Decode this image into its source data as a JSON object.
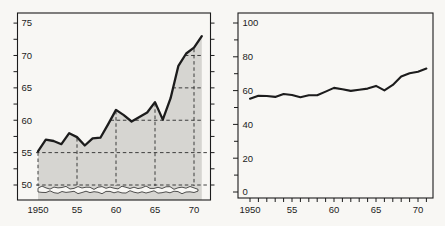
{
  "figure": {
    "background": "#f8f7f4",
    "ink_color": "#1c1c1c",
    "area_fill_color": "#d6d5d1"
  },
  "chart_data": [
    {
      "id": "left-magnified-scale",
      "type": "area",
      "title": "",
      "xlabel": "",
      "ylabel": "",
      "x": [
        1950,
        1951,
        1952,
        1953,
        1954,
        1955,
        1956,
        1957,
        1958,
        1959,
        1960,
        1961,
        1962,
        1963,
        1964,
        1965,
        1966,
        1967,
        1968,
        1969,
        1970,
        1971
      ],
      "series": [
        {
          "name": "value",
          "values": [
            55.2,
            57,
            56.8,
            56.3,
            58,
            57.4,
            56.1,
            57.2,
            57.3,
            59.4,
            61.6,
            60.8,
            59.8,
            60.5,
            61.2,
            62.8,
            60.1,
            63.4,
            68.4,
            70.3,
            71.2,
            73
          ]
        }
      ],
      "ylim": [
        47.7,
        76.6
      ],
      "yticks": [
        50,
        55,
        60,
        65,
        70,
        75
      ],
      "ytick_labels": [
        "50",
        "55",
        "60",
        "65",
        "70",
        "75"
      ],
      "ytick_minor_step": 2.5,
      "xticks": [
        1950,
        1955,
        1960,
        1965,
        1970
      ],
      "xtick_labels": [
        "1950",
        "55",
        "60",
        "65",
        "70"
      ],
      "grid": "dashed lines at 5-unit / 5-year steps, drawn only inside shaded area",
      "scale_break": true,
      "area_shaded": true,
      "legend": "none"
    },
    {
      "id": "right-full-scale",
      "type": "line",
      "title": "",
      "xlabel": "",
      "ylabel": "",
      "x": [
        1950,
        1951,
        1952,
        1953,
        1954,
        1955,
        1956,
        1957,
        1958,
        1959,
        1960,
        1961,
        1962,
        1963,
        1964,
        1965,
        1966,
        1967,
        1968,
        1969,
        1970,
        1971
      ],
      "series": [
        {
          "name": "value",
          "values": [
            55.2,
            57,
            56.8,
            56.3,
            58,
            57.4,
            56.1,
            57.2,
            57.3,
            59.4,
            61.6,
            60.8,
            59.8,
            60.5,
            61.2,
            62.8,
            60.1,
            63.4,
            68.4,
            70.3,
            71.2,
            73
          ]
        }
      ],
      "ylim": [
        -3.6,
        105.9
      ],
      "yticks": [
        0,
        20,
        40,
        60,
        80,
        100
      ],
      "ytick_labels": [
        "0",
        "20",
        "40",
        "60",
        "80",
        "100"
      ],
      "ytick_minor_step": 10,
      "xticks": [
        1950,
        1955,
        1960,
        1965,
        1970
      ],
      "xtick_labels": [
        "1950",
        "55",
        "60",
        "65",
        "70"
      ],
      "xtick_minor_step": 1,
      "grid": "off",
      "scale_break": false,
      "area_shaded": false,
      "legend": "none"
    }
  ]
}
